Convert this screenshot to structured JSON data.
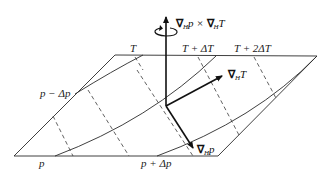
{
  "diagram": {
    "colors": {
      "line": "#2a2a2a",
      "vector": "#111111",
      "background": "#ffffff"
    },
    "temperature_labels": [
      {
        "id": "T0",
        "text": "T"
      },
      {
        "id": "T1",
        "text": "T + ΔT"
      },
      {
        "id": "T2",
        "text": "T + 2ΔT"
      }
    ],
    "pressure_labels": [
      {
        "id": "pm",
        "text": "p − Δp"
      },
      {
        "id": "p0",
        "text": "p"
      },
      {
        "id": "pp",
        "text": "p + Δp"
      }
    ],
    "vectors": {
      "cross": {
        "nabla": "∇",
        "sub": "H",
        "text_a": "p × ",
        "text_b": "T",
        "label": "∇Hp × ∇HT"
      },
      "grad_T": {
        "nabla": "∇",
        "sub": "H",
        "text": "T",
        "label": "∇HT"
      },
      "grad_p": {
        "nabla": "∇",
        "sub": "H",
        "text": "p",
        "label": "∇Hp"
      }
    },
    "rotation_symbol": "circular-arrow"
  }
}
